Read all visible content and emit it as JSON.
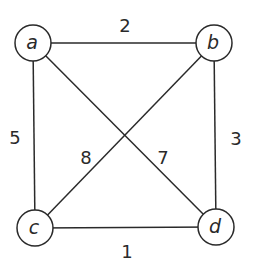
{
  "graph": {
    "nodes": [
      {
        "id": "a",
        "label": "a",
        "x": 33,
        "y": 43
      },
      {
        "id": "b",
        "label": "b",
        "x": 214,
        "y": 43
      },
      {
        "id": "c",
        "label": "c",
        "x": 35,
        "y": 228
      },
      {
        "id": "d",
        "label": "d",
        "x": 216,
        "y": 227
      }
    ],
    "edges": [
      {
        "from": "a",
        "to": "b",
        "weight": "2",
        "label_x": 125,
        "label_y": 32
      },
      {
        "from": "a",
        "to": "c",
        "weight": "5",
        "label_x": 15,
        "label_y": 144
      },
      {
        "from": "b",
        "to": "d",
        "weight": "3",
        "label_x": 236,
        "label_y": 145
      },
      {
        "from": "b",
        "to": "c",
        "weight": "8",
        "label_x": 86,
        "label_y": 164
      },
      {
        "from": "a",
        "to": "d",
        "weight": "7",
        "label_x": 163,
        "label_y": 164
      },
      {
        "from": "c",
        "to": "d",
        "weight": "1",
        "label_x": 127,
        "label_y": 258
      }
    ],
    "node_radius": 18,
    "stroke_color": "#2a2a2a"
  }
}
